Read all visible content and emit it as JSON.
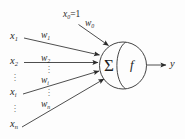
{
  "diagram": {
    "colors": {
      "background": "#fdfdfd",
      "stroke": "#3a3a3a",
      "text": "#2b2b2b"
    },
    "bias": {
      "input_base": "x",
      "input_sub": "0",
      "input_eq": "=1",
      "weight_base": "w",
      "weight_sub": "0"
    },
    "inputs": [
      {
        "base": "x",
        "sub": "1",
        "weight_base": "w",
        "weight_sub": "1"
      },
      {
        "base": "x",
        "sub": "2",
        "weight_base": "w",
        "weight_sub": "2"
      },
      {
        "base": "x",
        "sub": "i",
        "weight_base": "w",
        "weight_sub": "i"
      },
      {
        "base": "x",
        "sub": "n",
        "weight_base": "w",
        "weight_sub": "n"
      }
    ],
    "body": {
      "summation_symbol": "Σ",
      "activation_symbol": "f"
    },
    "output": {
      "label": "y"
    },
    "ellipsis": {
      "dot": "·"
    }
  }
}
